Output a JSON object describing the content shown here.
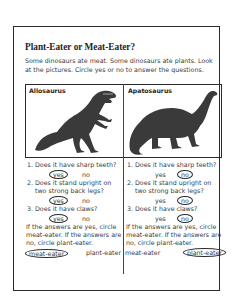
{
  "worksheet": {
    "title": "Plant-Eater or Meat-Eater?",
    "intro": "Some dinosaurs ate meat. Some dinosaurs ate plants. Look at the pictures. Circle yes or no to answer the questions.",
    "columns": [
      {
        "name": "Allosaurus",
        "image": "allosaurus-illustration",
        "questions": [
          {
            "text": "1. Does it have sharp teeth?",
            "yes": "yes",
            "no": "no",
            "circled": "yes"
          },
          {
            "text": "2. Does it stand upright on two strong back legs?",
            "line1": "2. Does it stand upright on",
            "line2": "two strong back legs?",
            "yes": "yes",
            "no": "no",
            "circled": "yes"
          },
          {
            "text": "3. Does it have claws?",
            "yes": "yes",
            "no": "no",
            "circled": "yes"
          }
        ],
        "instruction": "If the answers are yes, circle meat-eater. If the answers are no, circle plant-eater.",
        "choices": {
          "meat": "meat-eater",
          "plant": "plant-eater",
          "circled": "meat-eater"
        }
      },
      {
        "name": "Apatosaurus",
        "image": "apatosaurus-illustration",
        "questions": [
          {
            "text": "1. Does it have sharp teeth?",
            "yes": "yes",
            "no": "no",
            "circled": "no"
          },
          {
            "text": "2. Does it stand upright on two strong back legs?",
            "line1": "2. Does it stand upright on",
            "line2": "two strong back legs?",
            "yes": "yes",
            "no": "no",
            "circled": "no"
          },
          {
            "text": "3. Does it have claws?",
            "yes": "yes",
            "no": "no",
            "circled": "no"
          }
        ],
        "instruction": "If the answers are yes, circle meat-eater. If the answers are no, circle plant-eater.",
        "choices": {
          "meat": "meat-eater",
          "plant": "plant-eater",
          "circled": "plant-eater"
        }
      }
    ]
  }
}
